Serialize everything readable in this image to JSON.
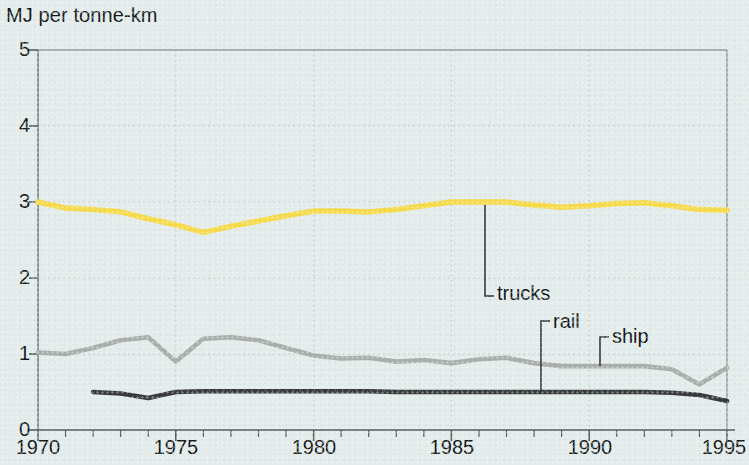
{
  "chart_data": {
    "type": "line",
    "title": "MJ per tonne-km",
    "xlabel": "",
    "ylabel": "MJ per tonne-km",
    "xlim": [
      1970,
      1995
    ],
    "ylim": [
      0,
      5
    ],
    "yticks": [
      "0",
      "1",
      "2",
      "3",
      "4",
      "5"
    ],
    "xticks": [
      "1970",
      "1975",
      "1980",
      "1985",
      "1990",
      "1995"
    ],
    "xtick_step_minor": 1,
    "grid": "dotted gridlines at integer y values and 5-year x intervals",
    "legend": "inline labels with leader lines",
    "x": [
      1970,
      1971,
      1972,
      1973,
      1974,
      1975,
      1976,
      1977,
      1978,
      1979,
      1980,
      1981,
      1982,
      1983,
      1984,
      1985,
      1986,
      1987,
      1988,
      1989,
      1990,
      1991,
      1992,
      1993,
      1994,
      1995
    ],
    "series": [
      {
        "name": "trucks",
        "color": "#f7da4a",
        "x": [
          1970,
          1971,
          1972,
          1973,
          1974,
          1975,
          1976,
          1977,
          1978,
          1979,
          1980,
          1981,
          1982,
          1983,
          1984,
          1985,
          1986,
          1987,
          1988,
          1989,
          1990,
          1991,
          1992,
          1993,
          1994,
          1995
        ],
        "values": [
          3.0,
          2.92,
          2.9,
          2.87,
          2.78,
          2.7,
          2.6,
          2.68,
          2.75,
          2.82,
          2.88,
          2.88,
          2.87,
          2.9,
          2.95,
          3.0,
          3.0,
          3.0,
          2.96,
          2.93,
          2.95,
          2.98,
          2.99,
          2.95,
          2.9,
          2.89
        ]
      },
      {
        "name": "ship",
        "color": "#a9adac",
        "x": [
          1970,
          1971,
          1972,
          1973,
          1974,
          1975,
          1976,
          1977,
          1978,
          1979,
          1980,
          1981,
          1982,
          1983,
          1984,
          1985,
          1986,
          1987,
          1988,
          1989,
          1990,
          1991,
          1992,
          1993,
          1994,
          1995
        ],
        "values": [
          1.02,
          1.0,
          1.08,
          1.18,
          1.22,
          0.9,
          1.2,
          1.22,
          1.18,
          1.08,
          0.98,
          0.94,
          0.95,
          0.9,
          0.92,
          0.88,
          0.93,
          0.95,
          0.88,
          0.84,
          0.84,
          0.84,
          0.84,
          0.8,
          0.6,
          0.82
        ]
      },
      {
        "name": "rail",
        "color": "#38393b",
        "x": [
          1972,
          1973,
          1974,
          1975,
          1976,
          1977,
          1978,
          1979,
          1980,
          1981,
          1982,
          1983,
          1984,
          1985,
          1986,
          1987,
          1988,
          1989,
          1990,
          1991,
          1992,
          1993,
          1994,
          1995
        ],
        "values": [
          0.5,
          0.48,
          0.42,
          0.5,
          0.51,
          0.51,
          0.51,
          0.51,
          0.51,
          0.51,
          0.51,
          0.5,
          0.5,
          0.5,
          0.5,
          0.5,
          0.5,
          0.5,
          0.5,
          0.5,
          0.5,
          0.49,
          0.46,
          0.38
        ]
      }
    ],
    "annotations": [
      {
        "text": "trucks",
        "points_to_series": "trucks",
        "at_x": 1986
      },
      {
        "text": "rail",
        "points_to_series": "rail",
        "at_x": 1988
      },
      {
        "text": "ship",
        "points_to_series": "ship",
        "at_x": 1990
      }
    ]
  },
  "axis": {
    "title": "MJ per tonne-km",
    "y_labels": [
      "5",
      "4",
      "3",
      "2",
      "1",
      "0"
    ],
    "x_labels": [
      "1970",
      "1975",
      "1980",
      "1985",
      "1990",
      "1995"
    ]
  },
  "labels": {
    "trucks": "trucks",
    "rail": "rail",
    "ship": "ship"
  },
  "colors": {
    "trucks": "#f7da4a",
    "ship": "#a9adac",
    "rail": "#38393b",
    "axis": "#55605f",
    "grid": "#b9c6c5",
    "background": "#e3ecea",
    "text": "#16191b"
  }
}
